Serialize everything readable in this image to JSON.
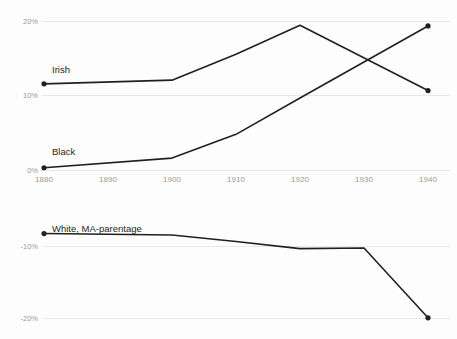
{
  "chart_data": {
    "type": "line",
    "title": "",
    "subtitle": "",
    "xlabel": "",
    "ylabel": "",
    "grid": true,
    "legend_position": "inline-series-labels",
    "panels": [
      {
        "name": "upper-panel",
        "x": [
          1880,
          1890,
          1900,
          1910,
          1920,
          1930,
          1940
        ],
        "xlim": [
          1880,
          1940
        ],
        "ylim": [
          0,
          20
        ],
        "yticks": [
          0,
          10,
          20
        ],
        "ytick_labels": [
          "0%",
          "10%",
          "20%"
        ],
        "xticks": [
          1880,
          1890,
          1900,
          1910,
          1920,
          1930,
          1940
        ],
        "xtick_labels": [
          "1880",
          "1890",
          "1900",
          "1910",
          "1920",
          "1930",
          "1940"
        ],
        "series": [
          {
            "name": "Irish",
            "label": "Irish",
            "x": [
              1880,
              1900,
              1910,
              1920,
              1940
            ],
            "values": [
              11.6,
              12.1,
              15.6,
              19.5,
              10.7
            ],
            "color": "#231f20",
            "markers_at": [
              1880,
              1940
            ]
          },
          {
            "name": "Black",
            "label": "Black",
            "x": [
              1880,
              1900,
              1910,
              1920,
              1940
            ],
            "values": [
              0.3,
              1.6,
              4.8,
              9.7,
              19.4
            ],
            "color": "#231f20",
            "markers_at": [
              1880,
              1940
            ]
          }
        ]
      },
      {
        "name": "lower-panel",
        "x": [
          1880,
          1890,
          1900,
          1910,
          1920,
          1930,
          1940
        ],
        "xlim": [
          1880,
          1940
        ],
        "ylim": [
          -21.5,
          -7.5
        ],
        "yticks": [
          -10,
          -20
        ],
        "ytick_labels": [
          "-10%",
          "-20%"
        ],
        "xticks": [],
        "xtick_labels": [],
        "series": [
          {
            "name": "White, MA-parentage",
            "label": "White, MA-parentage",
            "x": [
              1880,
              1900,
              1910,
              1920,
              1930,
              1940
            ],
            "values": [
              -8.2,
              -8.4,
              -9.3,
              -10.3,
              -10.2,
              -19.9
            ],
            "color": "#231f20",
            "markers_at": [
              1880,
              1940
            ]
          }
        ]
      }
    ]
  },
  "labels": {
    "irish": "Irish",
    "black": "Black",
    "white_ma": "White, MA-parentage",
    "y_20": "20%",
    "y_10": "10%",
    "y_0": "0%",
    "y_neg10": "-10%",
    "y_neg20": "-20%",
    "x_1880": "1880",
    "x_1890": "1890",
    "x_1900": "1900",
    "x_1910": "1910",
    "x_1920": "1920",
    "x_1930": "1930",
    "x_1940": "1940"
  },
  "colors": {
    "line": "#231f20",
    "grid": "#e8e8e8",
    "tick_text": "#9a9a9a",
    "label_text": "#231f20",
    "background": "#fdfdfd"
  }
}
